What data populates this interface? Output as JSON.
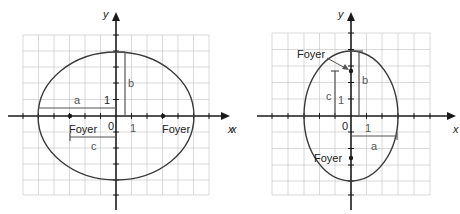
{
  "figures": [
    {
      "id": "horizontal-ellipse",
      "axis_labels": {
        "x": "x",
        "y": "y"
      },
      "origin_label": "0",
      "unit_x_label": "1",
      "unit_y_label": "1",
      "segment_labels": {
        "a": "a",
        "b": "b",
        "c": "c"
      },
      "foci": [
        {
          "label": "Foyer",
          "x": -3,
          "y": 0
        },
        {
          "label": "Foyer",
          "x": 3,
          "y": 0
        }
      ],
      "ellipse": {
        "center": [
          0,
          0
        ],
        "semi_major_x": 5,
        "semi_minor_y": 4
      }
    },
    {
      "id": "vertical-ellipse",
      "axis_labels": {
        "x": "x",
        "y": "y"
      },
      "origin_label": "0",
      "unit_x_label": "1",
      "unit_y_label": "1",
      "segment_labels": {
        "a": "a",
        "b": "b",
        "c": "c"
      },
      "foci": [
        {
          "label": "Foyer",
          "x": 0,
          "y": 2.6
        },
        {
          "label": "Foyer",
          "x": 0,
          "y": -2.6
        }
      ],
      "ellipse": {
        "center": [
          0,
          0
        ],
        "semi_minor_x": 3,
        "semi_major_y": 4
      }
    }
  ],
  "colors": {
    "axis": "#1a1a1a",
    "grid": "#c8c8c8",
    "curve": "#3a3a3a"
  }
}
